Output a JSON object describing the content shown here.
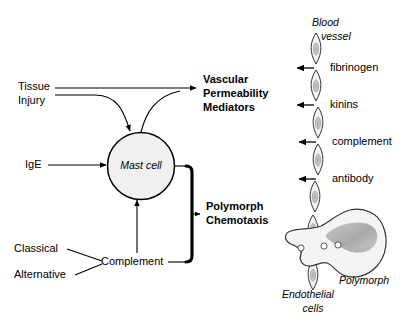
{
  "figure": {
    "kind": "biological-pathway-diagram",
    "background_color": "#ffffff",
    "line_color": "#000000",
    "cell_fill_color": "#f0f0f0",
    "nucleus_fill_color": "#c8c8c8",
    "polymorph_nucleus_color": "#b4b4b4"
  },
  "left_pathway": {
    "stimuli": {
      "tissue_injury_line1": "Tissue",
      "tissue_injury_line2": "Injury",
      "ige": "IgE",
      "classical": "Classical",
      "alternative": "Alternative"
    },
    "nodes": {
      "mast_cell": "Mast cell",
      "complement": "Complement"
    },
    "outputs": {
      "vascular_line1": "Vascular",
      "vascular_line2": "Permeability",
      "vascular_line3": "Mediators",
      "polymorph_line1": "Polymorph",
      "polymorph_line2": "Chemotaxis"
    }
  },
  "right_panel": {
    "vessel_label_line1": "Blood",
    "vessel_label_line2": "vessel",
    "mediators": [
      "fibrinogen",
      "kinins",
      "complement",
      "antibody"
    ],
    "polymorph_label": "Polymorph",
    "endothelial_label_line1": "Endothelial",
    "endothelial_label_line2": "cells"
  }
}
